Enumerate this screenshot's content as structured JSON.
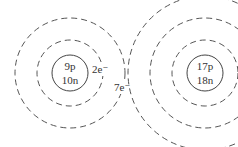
{
  "atoms": [
    {
      "name": "fluorine",
      "nucleus": {
        "protons": "9p",
        "neutrons": "10n"
      },
      "shell_labels": [
        "2e⁻",
        "7e⁻"
      ],
      "shell_count": 2
    },
    {
      "name": "chlorine",
      "nucleus": {
        "protons": "17p",
        "neutrons": "18n"
      },
      "shell_count": 3
    }
  ],
  "colors": {
    "stroke": "#555555",
    "text": "#333333"
  }
}
